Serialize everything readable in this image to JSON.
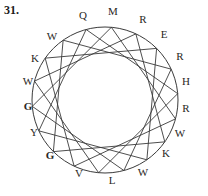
{
  "problem": {
    "number": "31."
  },
  "figure": {
    "name": "star-polygon-circle-diagram",
    "stroke_color": "#3a3a3a",
    "label_color": "#2a2724",
    "background_color": "#ffffff",
    "circle": {
      "cx": 105,
      "cy": 100,
      "r": 73
    },
    "point_count": 18,
    "chord_step": 5,
    "labels": [
      {
        "text": "Q",
        "x": 83,
        "y": 19,
        "bold": false
      },
      {
        "text": "M",
        "x": 113,
        "y": 15,
        "bold": false
      },
      {
        "text": "R",
        "x": 143,
        "y": 23,
        "bold": false
      },
      {
        "text": "E",
        "x": 164,
        "y": 38,
        "bold": false
      },
      {
        "text": "R",
        "x": 180,
        "y": 60,
        "bold": false
      },
      {
        "text": "H",
        "x": 186,
        "y": 85,
        "bold": false
      },
      {
        "text": "R",
        "x": 186,
        "y": 112,
        "bold": false
      },
      {
        "text": "W",
        "x": 180,
        "y": 137,
        "bold": false
      },
      {
        "text": "K",
        "x": 166,
        "y": 157,
        "bold": false
      },
      {
        "text": "W",
        "x": 143,
        "y": 176,
        "bold": false
      },
      {
        "text": "L",
        "x": 112,
        "y": 184,
        "bold": false
      },
      {
        "text": "V",
        "x": 79,
        "y": 177,
        "bold": false
      },
      {
        "text": "G",
        "x": 50,
        "y": 159,
        "bold": true
      },
      {
        "text": "Y",
        "x": 34,
        "y": 136,
        "bold": false
      },
      {
        "text": "G",
        "x": 28,
        "y": 110,
        "bold": true
      },
      {
        "text": "W",
        "x": 28,
        "y": 85,
        "bold": false
      },
      {
        "text": "K",
        "x": 35,
        "y": 62,
        "bold": false
      },
      {
        "text": "W",
        "x": 52,
        "y": 40,
        "bold": false
      }
    ]
  }
}
